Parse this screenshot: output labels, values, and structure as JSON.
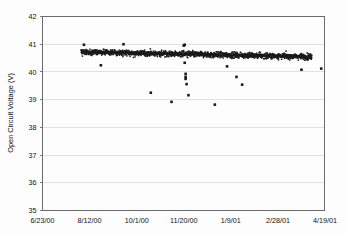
{
  "figure": {
    "name": "open-circuit-voltage-scatter-chart",
    "background_color": "#fdfdfd"
  },
  "chart_data": {
    "type": "scatter",
    "title": "",
    "subtitle": "",
    "xlabel": "",
    "ylabel": "Open Circuit Voltage (V)",
    "ylim": [
      35,
      42
    ],
    "ytick_values": [
      35,
      36,
      37,
      38,
      39,
      40,
      41,
      42
    ],
    "ytick_labels": [
      "35",
      "36",
      "37",
      "38",
      "39",
      "40",
      "41",
      "42"
    ],
    "xlim_labels": [
      "6/23/00",
      "4/19/01"
    ],
    "xtick_labels": [
      "6/23/00",
      "8/12/00",
      "10/1/00",
      "11/20/00",
      "1/9/01",
      "2/28/01",
      "4/19/01"
    ],
    "xtick_positions_days": [
      0,
      50,
      100,
      150,
      200,
      250,
      300
    ],
    "x_axis_type": "date",
    "x_start_date": "6/23/00",
    "x_end_date": "4/19/01",
    "grid": "horizontal",
    "legend": "none",
    "marker": "small black square",
    "marker_color": "#1a1a1a",
    "trend_color": "#5b5b5b",
    "series": [
      {
        "name": "Open Circuit Voltage",
        "description": "Dense band of daily open circuit voltage readings spanning approximately 8/3/00 through 4/4/01, centered near 40.70 V at the start and drifting down to about 40.55 V at the end, with a spread of roughly plus or minus 0.15 V and occasional low outliers.",
        "band_start_day": 41,
        "band_end_day": 286,
        "band_center_start_v": 40.72,
        "band_center_end_v": 40.55,
        "band_spread_v": 0.16,
        "n_points": 1400
      }
    ],
    "outliers": [
      {
        "x_days": 62,
        "y": 40.24
      },
      {
        "x_days": 115,
        "y": 39.25
      },
      {
        "x_days": 137,
        "y": 38.92
      },
      {
        "x_days": 151,
        "y": 40.33
      },
      {
        "x_days": 152,
        "y": 39.93
      },
      {
        "x_days": 152,
        "y": 39.82
      },
      {
        "x_days": 152,
        "y": 39.75
      },
      {
        "x_days": 153,
        "y": 39.56
      },
      {
        "x_days": 155,
        "y": 39.16
      },
      {
        "x_days": 150,
        "y": 40.95
      },
      {
        "x_days": 183,
        "y": 38.82
      },
      {
        "x_days": 196,
        "y": 40.2
      },
      {
        "x_days": 206,
        "y": 39.82
      },
      {
        "x_days": 212,
        "y": 39.54
      },
      {
        "x_days": 275,
        "y": 40.08
      },
      {
        "x_days": 296,
        "y": 40.12
      },
      {
        "x_days": 44,
        "y": 40.98
      },
      {
        "x_days": 86,
        "y": 41.0
      },
      {
        "x_days": 151,
        "y": 40.98
      }
    ]
  },
  "axes": {
    "y_title": "Open Circuit Voltage (V)",
    "frame_color": "#6b6b6b",
    "grid_color": "#d9d9d9"
  }
}
